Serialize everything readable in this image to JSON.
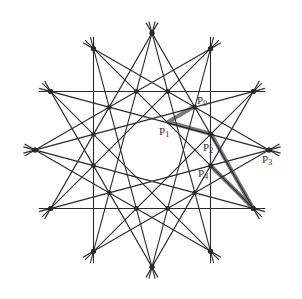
{
  "diagram": {
    "type": "twelve-fold star line arrangement",
    "center": [
      152,
      150
    ],
    "outer_radius": 117,
    "vertex_count": 12,
    "chord_steps": [
      4,
      5
    ],
    "stub_extension": 12,
    "line_color": "#2a2a2a",
    "dot_color": "#2a2a2a",
    "highlight_color": "#7a7a7a",
    "inner_hole_radius": 20
  },
  "points": [
    {
      "id": "P0",
      "base": "P",
      "sub": "0",
      "x": 195,
      "y": 106,
      "label_x": 197,
      "label_y": 95
    },
    {
      "id": "P1",
      "base": "P",
      "sub": "1",
      "x": 168,
      "y": 122,
      "label_x": 159,
      "label_y": 126
    },
    {
      "id": "P2",
      "base": "P",
      "sub": "2",
      "x": 211,
      "y": 134,
      "label_x": 203,
      "label_y": 142
    },
    {
      "id": "P3",
      "base": "P",
      "sub": "3",
      "x": 268,
      "y": 149,
      "label_x": 262,
      "label_y": 154
    },
    {
      "id": "P4",
      "base": "P",
      "sub": "4",
      "x": 210,
      "y": 165,
      "label_x": 198,
      "label_y": 168
    }
  ],
  "highlight_path": [
    [
      [
        195,
        106
      ],
      [
        168,
        122
      ],
      [
        211,
        134
      ],
      [
        253,
        208
      ]
    ],
    [
      [
        210,
        165
      ],
      [
        253,
        208
      ]
    ]
  ]
}
